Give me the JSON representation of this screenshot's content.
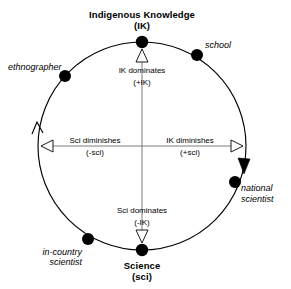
{
  "diagram": {
    "type": "conceptual-cycle-diagram",
    "shape": "circle",
    "geometry": {
      "center_x": 142,
      "center_y": 146,
      "radius": 104
    },
    "poles": [
      {
        "id": "ik-pole",
        "label_line1": "Indigenous Knowledge",
        "label_line2": "(IK)",
        "position": "top",
        "angle_deg": 90
      },
      {
        "id": "sci-pole",
        "label_line1": "Science",
        "label_line2": "(sci)",
        "position": "bottom",
        "angle_deg": 270
      }
    ],
    "actors": [
      {
        "id": "ethnographer",
        "label_line1": "ethnographer",
        "label_line2": "",
        "angle_deg": 132,
        "x": 65,
        "y": 76,
        "label_x": 8,
        "label_y": 70,
        "label_anchor": "start"
      },
      {
        "id": "school",
        "label_line1": "school",
        "label_line2": "",
        "angle_deg": 57,
        "x": 197,
        "y": 55,
        "label_x": 205,
        "label_y": 48,
        "label_anchor": "start"
      },
      {
        "id": "national-scientist",
        "label_line1": "national",
        "label_line2": "scientist",
        "angle_deg": 338,
        "x": 235,
        "y": 182,
        "label_x": 241,
        "label_y": 191,
        "label_anchor": "start"
      },
      {
        "id": "in-country-scientist",
        "label_line1": "in-country",
        "label_line2": "scientist",
        "angle_deg": 244,
        "x": 88,
        "y": 239,
        "label_x": 80,
        "label_y": 255,
        "label_anchor": "end"
      }
    ],
    "transitions": [
      {
        "id": "ik-dominates",
        "label_line1": "IK dominates",
        "label_line2": "(+IK)",
        "direction": "up",
        "arrow_x": 142,
        "arrow_tip_y": 49,
        "label_x": 142,
        "label_y1": 73,
        "label_y2": 85
      },
      {
        "id": "sci-dominates",
        "label_line1": "Sci dominates",
        "label_line2": "(-IK)",
        "direction": "down",
        "arrow_x": 142,
        "arrow_tip_y": 243,
        "label_x": 142,
        "label_y1": 213,
        "label_y2": 225
      },
      {
        "id": "sci-diminishes",
        "label_line1": "Sci diminishes",
        "label_line2": "(-sci)",
        "direction": "left",
        "arrow_tip_x": 41,
        "arrow_y": 146,
        "label_x": 95,
        "label_y1": 142,
        "label_y2": 154
      },
      {
        "id": "ik-diminishes",
        "label_line1": "IK diminishes",
        "label_line2": "(+sci)",
        "direction": "right",
        "arrow_tip_x": 243,
        "arrow_y": 146,
        "label_x": 190,
        "label_y1": 142,
        "label_y2": 154
      }
    ],
    "arc_arrows": [
      {
        "id": "left-arc-arrow-up",
        "style": "open",
        "direction": "counterclockwise-upward",
        "x": 37,
        "y": 124
      },
      {
        "id": "right-arc-arrow-down",
        "style": "filled",
        "direction": "clockwise-downward",
        "x": 244,
        "y": 166
      }
    ],
    "colors": {
      "stroke": "#000000",
      "axis": "#6e6e6e",
      "node_fill": "#000000",
      "arrow_fill": "#ffffff",
      "background": "#ffffff"
    }
  }
}
